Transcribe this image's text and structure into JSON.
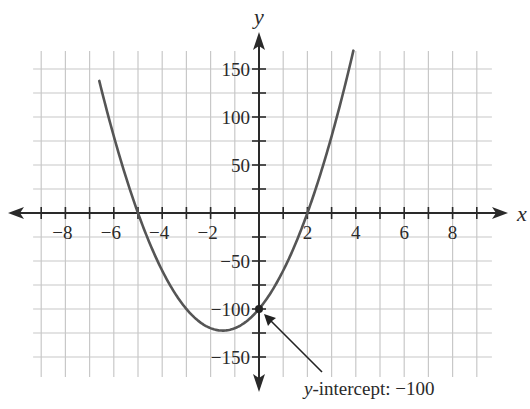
{
  "chart_data": {
    "type": "line",
    "title": "",
    "xlabel": "x",
    "ylabel": "y",
    "function": "y = 10x^2 + 30x - 100",
    "xlim": [
      -9,
      9.5
    ],
    "ylim": [
      -175,
      175
    ],
    "grid": true,
    "x_grid_step": 1,
    "y_grid_step": 25,
    "x_ticks": [
      -8,
      -6,
      -4,
      -2,
      2,
      4,
      6,
      8
    ],
    "x_tick_labels": [
      "−8",
      "−6",
      "−4",
      "−2",
      "2",
      "4",
      "6",
      "8"
    ],
    "y_ticks": [
      150,
      100,
      50,
      -50,
      -100,
      -150
    ],
    "y_tick_labels": [
      "150",
      "100",
      "50",
      "−50",
      "−100",
      "−150"
    ],
    "series": [
      {
        "name": "parabola",
        "x": [
          -6.6,
          -6,
          -5,
          -4,
          -3,
          -2,
          -1.5,
          -1,
          0,
          1,
          2,
          3,
          3.9
        ],
        "y": [
          137.6,
          80,
          0,
          -60,
          -100,
          -120,
          -122.5,
          -120,
          -100,
          -60,
          0,
          80,
          165.1
        ]
      }
    ],
    "annotations": [
      {
        "point": [
          0,
          -100
        ],
        "text_prefix": "y",
        "text_suffix": "-intercept: −100"
      }
    ],
    "key_points": {
      "x_intercepts": [
        -5,
        2
      ],
      "vertex": [
        -1.5,
        -122.5
      ],
      "y_intercept": -100
    }
  },
  "colors": {
    "curve": "#555555",
    "axis": "#2a2a2a",
    "grid": "#c8c8c8",
    "background": "#ffffff"
  },
  "labels": {
    "x_axis": "x",
    "y_axis": "y",
    "annotation_prefix": "y",
    "annotation_suffix": "-intercept: −100"
  }
}
